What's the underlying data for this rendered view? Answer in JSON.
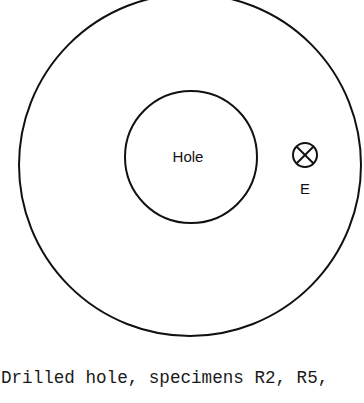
{
  "diagram": {
    "outer_circle": {
      "cx": 190,
      "cy": 165,
      "r": 171
    },
    "inner_circle": {
      "cx": 191,
      "cy": 157,
      "r": 66,
      "label": "Hole"
    },
    "sensor_symbol": {
      "cx": 305,
      "cy": 155,
      "r": 12,
      "label": "E"
    },
    "stroke_color": "#111111"
  },
  "caption": "Drilled hole, specimens R2, R5,"
}
